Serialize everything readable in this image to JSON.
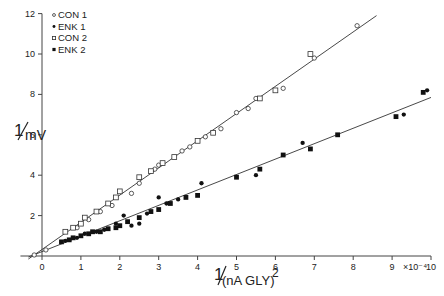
{
  "chart_data": {
    "type": "scatter",
    "title": "",
    "xlabel": "1/(nA GLY)^2",
    "xlabel_parts": {
      "num": "1",
      "den": "(nA GLY)",
      "exp": "2"
    },
    "ylabel": "1/mV",
    "ylabel_parts": {
      "num": "1",
      "den": "mV"
    },
    "x_multiplier": "×10⁻⁴",
    "xlim": [
      -0.4,
      10
    ],
    "ylim": [
      0,
      12
    ],
    "xticks": [
      0,
      1,
      2,
      3,
      4,
      5,
      6,
      7,
      8,
      9,
      10
    ],
    "yticks": [
      2,
      4,
      6,
      8,
      10,
      12
    ],
    "ytick_labels": [
      "2",
      "4",
      "6",
      "8",
      "10",
      "12"
    ],
    "grid": false,
    "legend": {
      "position": "upper-left",
      "entries": [
        {
          "label": "CON 1",
          "marker": "open-circle"
        },
        {
          "label": "ENK 1",
          "marker": "filled-circle"
        },
        {
          "label": "CON 2",
          "marker": "open-square"
        },
        {
          "label": "ENK 2",
          "marker": "filled-square"
        }
      ]
    },
    "fit_lines": [
      {
        "name": "CON fit",
        "x0": -0.35,
        "y0": -0.15,
        "x1": 8.6,
        "y1": 11.9
      },
      {
        "name": "ENK fit",
        "x0": -0.35,
        "y0": -0.05,
        "x1": 10.0,
        "y1": 7.85
      }
    ],
    "series": [
      {
        "name": "CON 1",
        "marker": "open-circle",
        "x": [
          -0.2,
          0.1,
          0.9,
          1.2,
          1.5,
          1.8,
          2.3,
          2.5,
          2.9,
          3.0,
          3.6,
          3.8,
          4.2,
          4.6,
          5.0,
          5.3,
          5.5,
          6.2,
          7.0,
          8.1
        ],
        "y": [
          0.05,
          0.3,
          1.4,
          1.8,
          2.2,
          2.5,
          3.1,
          3.6,
          4.3,
          4.5,
          5.2,
          5.4,
          5.9,
          6.3,
          7.1,
          7.3,
          7.8,
          8.3,
          9.8,
          11.4
        ]
      },
      {
        "name": "CON 2",
        "marker": "open-square",
        "x": [
          0.6,
          0.8,
          1.0,
          1.1,
          1.4,
          1.7,
          1.9,
          2.0,
          2.5,
          2.8,
          3.1,
          3.4,
          4.0,
          4.4,
          5.6,
          6.0,
          6.9
        ],
        "y": [
          1.2,
          1.4,
          1.6,
          1.9,
          2.2,
          2.6,
          2.9,
          3.2,
          3.9,
          4.2,
          4.6,
          4.9,
          5.7,
          6.1,
          7.8,
          8.2,
          10.0
        ]
      },
      {
        "name": "ENK 1",
        "marker": "filled-circle",
        "x": [
          0.6,
          0.9,
          1.1,
          1.4,
          1.6,
          1.9,
          2.1,
          2.3,
          2.5,
          2.7,
          3.0,
          3.2,
          3.5,
          4.1,
          5.5,
          6.7,
          9.3,
          9.9
        ],
        "y": [
          0.75,
          0.9,
          1.1,
          1.2,
          1.3,
          1.6,
          2.0,
          1.5,
          1.6,
          2.1,
          2.9,
          2.6,
          2.8,
          3.6,
          4.0,
          5.6,
          7.0,
          8.2
        ]
      },
      {
        "name": "ENK 2",
        "marker": "filled-square",
        "x": [
          0.5,
          0.7,
          0.8,
          1.0,
          1.2,
          1.3,
          1.5,
          1.7,
          1.9,
          2.0,
          2.2,
          2.5,
          2.8,
          3.0,
          3.3,
          3.7,
          4.0,
          5.0,
          5.6,
          6.2,
          6.9,
          7.6,
          9.1,
          9.8
        ],
        "y": [
          0.7,
          0.8,
          0.9,
          1.0,
          1.1,
          1.2,
          1.2,
          1.35,
          1.4,
          1.5,
          1.7,
          1.9,
          2.2,
          2.3,
          2.6,
          2.9,
          3.0,
          3.9,
          4.3,
          5.0,
          5.3,
          6.0,
          6.9,
          8.1
        ]
      }
    ]
  }
}
